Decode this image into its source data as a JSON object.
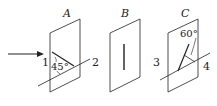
{
  "diagram": {
    "plates": [
      {
        "name": "A",
        "angle_label": "45°"
      },
      {
        "name": "B"
      },
      {
        "name": "C",
        "angle_label": "60°"
      }
    ],
    "regions": [
      "1",
      "2",
      "3",
      "4"
    ],
    "colors": {
      "stroke": "#222222",
      "background": "#ffffff"
    }
  }
}
